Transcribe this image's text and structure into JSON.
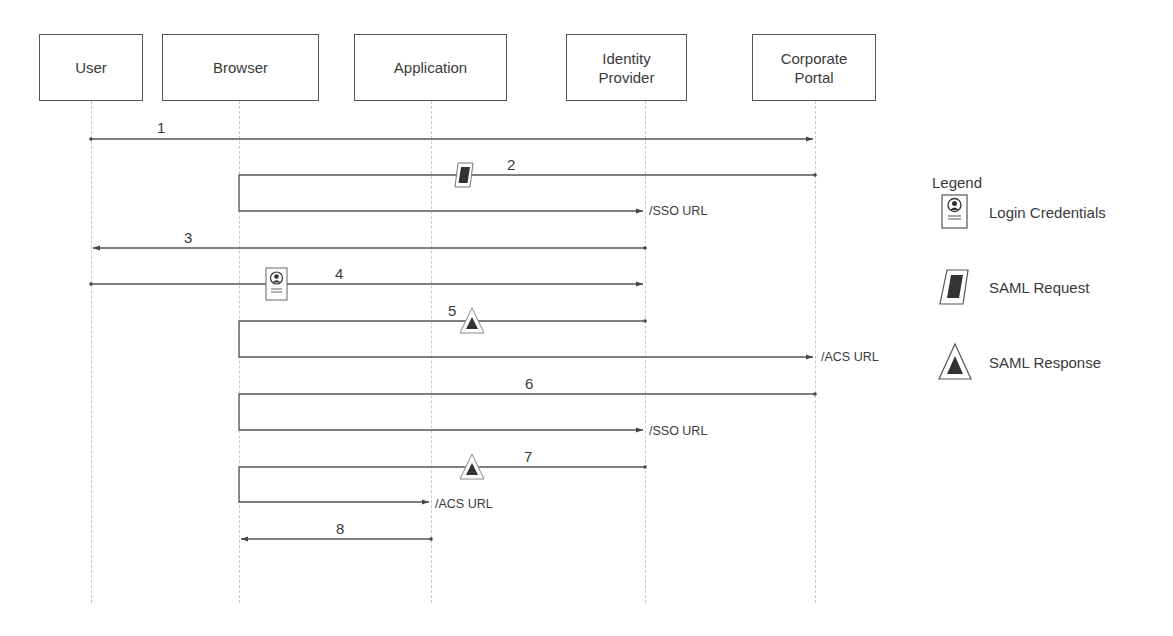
{
  "diagram": {
    "type": "sequence",
    "actors": [
      {
        "id": "user",
        "label": "User"
      },
      {
        "id": "browser",
        "label": "Browser"
      },
      {
        "id": "application",
        "label": "Application"
      },
      {
        "id": "idp",
        "label": "Identity Provider"
      },
      {
        "id": "portal",
        "label": "Corporate Portal"
      }
    ],
    "messages": [
      {
        "number": "1",
        "from": "user",
        "to": "portal",
        "artifact": null,
        "endpoint": null
      },
      {
        "number": "2",
        "from": "portal",
        "to": "idp",
        "via": "browser",
        "artifact": "saml-request",
        "endpoint": "/SSO URL"
      },
      {
        "number": "3",
        "from": "idp",
        "to": "user",
        "artifact": null,
        "endpoint": null
      },
      {
        "number": "4",
        "from": "user",
        "to": "idp",
        "artifact": "login-credentials",
        "endpoint": null
      },
      {
        "number": "5",
        "from": "idp",
        "to": "portal",
        "via": "browser",
        "artifact": "saml-response",
        "endpoint": "/ACS URL"
      },
      {
        "number": "6",
        "from": "portal",
        "to": "idp",
        "via": "browser",
        "artifact": null,
        "endpoint": "/SSO URL"
      },
      {
        "number": "7",
        "from": "idp",
        "to": "application",
        "via": "browser",
        "artifact": "saml-response",
        "endpoint": "/ACS URL"
      },
      {
        "number": "8",
        "from": "application",
        "to": "browser",
        "artifact": null,
        "endpoint": null
      }
    ]
  },
  "actors": {
    "user": "User",
    "browser": "Browser",
    "application": "Application",
    "idp_line1": "Identity",
    "idp_line2": "Provider",
    "portal_line1": "Corporate",
    "portal_line2": "Portal"
  },
  "labels": {
    "m1": "1",
    "m2": "2",
    "m3": "3",
    "m4": "4",
    "m5": "5",
    "m6": "6",
    "m7": "7",
    "m8": "8",
    "sso_url": "/SSO URL",
    "acs_url": "/ACS URL"
  },
  "legend": {
    "title": "Legend",
    "items": [
      {
        "icon": "login-credentials-icon",
        "label": "Login Credentials"
      },
      {
        "icon": "saml-request-icon",
        "label": "SAML Request"
      },
      {
        "icon": "saml-response-icon",
        "label": "SAML Response"
      }
    ]
  },
  "colors": {
    "line": "#555555",
    "lifeline": "#c8c8c8",
    "text": "#3a3a3a",
    "icon_fill": "#333333"
  }
}
